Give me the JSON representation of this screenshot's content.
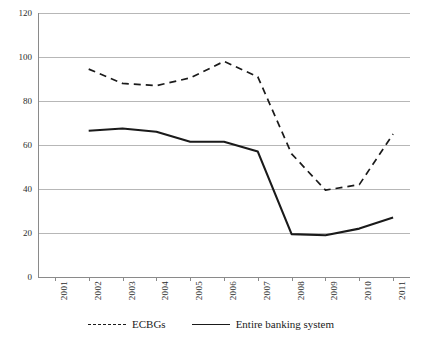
{
  "chart_data": {
    "type": "line",
    "title": "",
    "subtitle": "",
    "xlabel": "",
    "ylabel": "",
    "grid": true,
    "legend_position": "bottom",
    "ylim": [
      0,
      120
    ],
    "ytick_labels": [
      "0",
      "20",
      "40",
      "60",
      "80",
      "100",
      "120"
    ],
    "yticks": [
      0,
      20,
      40,
      60,
      80,
      100,
      120
    ],
    "categories": [
      "2001",
      "2002",
      "2003",
      "2004",
      "2005",
      "2006",
      "2007",
      "2008",
      "2009",
      "2010",
      "2011"
    ],
    "x": [
      "2001",
      "2002",
      "2003",
      "2004",
      "2005",
      "2006",
      "2007",
      "2008",
      "2009",
      "2010",
      "2011"
    ],
    "series": [
      {
        "name": "ECBGs",
        "style": "dashed",
        "color": "#1a1a1a",
        "values": [
          null,
          94.5,
          88.0,
          87.0,
          90.5,
          98.0,
          91.0,
          56.0,
          39.5,
          42.0,
          65.0
        ]
      },
      {
        "name": "Entire banking system",
        "style": "solid",
        "color": "#1a1a1a",
        "values": [
          null,
          66.5,
          67.5,
          66.0,
          61.5,
          61.5,
          57.0,
          19.5,
          19.0,
          22.0,
          27.0
        ]
      }
    ]
  },
  "legend": {
    "items": [
      {
        "label": "ECBGs",
        "style": "dashed"
      },
      {
        "label": "Entire banking system",
        "style": "solid"
      }
    ]
  }
}
